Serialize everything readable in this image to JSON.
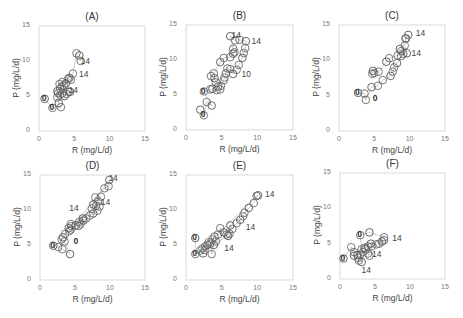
{
  "figure": {
    "xlabel": "R (mg/L/d)",
    "ylabel": "P (mg/L/d)",
    "ticks": [
      "0",
      "5",
      "10",
      "15"
    ]
  },
  "chart_data": [
    {
      "type": "scatter",
      "title": "(A)",
      "xlabel": "R (mg/L/d)",
      "ylabel": "P (mg/L/d)",
      "xlim": [
        0,
        15
      ],
      "ylim": [
        0,
        15
      ],
      "grid": false,
      "annotations": [
        {
          "text": "14",
          "x": 6.3,
          "y": 9.8
        },
        {
          "text": "14",
          "x": 6.1,
          "y": 8.0
        },
        {
          "text": "14",
          "x": 4.6,
          "y": 5.7
        },
        {
          "text": "0",
          "x": 0.8,
          "y": 4.6
        },
        {
          "text": "0",
          "x": 1.9,
          "y": 3.3
        }
      ],
      "points": [
        [
          0.8,
          4.6
        ],
        [
          1.9,
          3.3
        ],
        [
          3.1,
          3.4
        ],
        [
          2.8,
          4.0
        ],
        [
          2.6,
          4.8
        ],
        [
          2.7,
          5.4
        ],
        [
          2.6,
          5.7
        ],
        [
          3.0,
          5.2
        ],
        [
          3.3,
          5.4
        ],
        [
          3.6,
          5.0
        ],
        [
          3.9,
          5.3
        ],
        [
          4.2,
          5.6
        ],
        [
          4.4,
          5.6
        ],
        [
          3.0,
          6.0
        ],
        [
          3.2,
          6.3
        ],
        [
          3.5,
          6.5
        ],
        [
          2.9,
          6.7
        ],
        [
          3.3,
          7.0
        ],
        [
          3.8,
          6.8
        ],
        [
          4.1,
          7.4
        ],
        [
          4.5,
          7.3
        ],
        [
          4.3,
          7.6
        ],
        [
          4.8,
          8.2
        ],
        [
          5.3,
          11.1
        ],
        [
          5.7,
          10.8
        ],
        [
          5.9,
          10.0
        ]
      ]
    },
    {
      "type": "scatter",
      "title": "(B)",
      "xlabel": "R (mg/L/d)",
      "ylabel": "P (mg/L/d)",
      "xlim": [
        0,
        15
      ],
      "ylim": [
        0,
        15
      ],
      "grid": false,
      "annotations": [
        {
          "text": "14",
          "x": 6.8,
          "y": 13.5
        },
        {
          "text": "14",
          "x": 9.6,
          "y": 12.6
        },
        {
          "text": "10",
          "x": 8.2,
          "y": 7.9
        },
        {
          "text": "0",
          "x": 2.5,
          "y": 5.5
        },
        {
          "text": "0",
          "x": 2.5,
          "y": 2.1
        }
      ],
      "points": [
        [
          2.0,
          2.9
        ],
        [
          2.5,
          2.1
        ],
        [
          2.9,
          4.0
        ],
        [
          3.6,
          3.5
        ],
        [
          2.5,
          5.5
        ],
        [
          3.4,
          5.8
        ],
        [
          3.7,
          5.9
        ],
        [
          4.3,
          5.7
        ],
        [
          4.8,
          5.8
        ],
        [
          4.5,
          6.2
        ],
        [
          4.9,
          6.3
        ],
        [
          4.2,
          6.8
        ],
        [
          4.0,
          7.4
        ],
        [
          3.5,
          7.7
        ],
        [
          3.9,
          8.1
        ],
        [
          4.8,
          9.7
        ],
        [
          5.3,
          10.3
        ],
        [
          6.2,
          10.4
        ],
        [
          6.6,
          10.9
        ],
        [
          6.8,
          11.1
        ],
        [
          6.6,
          11.6
        ],
        [
          6.2,
          13.4
        ],
        [
          6.9,
          12.8
        ],
        [
          7.5,
          12.9
        ],
        [
          8.4,
          12.7
        ],
        [
          8.3,
          11.7
        ],
        [
          8.1,
          11.0
        ],
        [
          7.9,
          10.3
        ],
        [
          7.4,
          9.3
        ],
        [
          7.1,
          8.6
        ],
        [
          6.6,
          8.0
        ],
        [
          6.2,
          8.7
        ],
        [
          5.8,
          8.8
        ],
        [
          5.6,
          8.1
        ],
        [
          5.4,
          7.5
        ],
        [
          5.3,
          7.1
        ]
      ]
    },
    {
      "type": "scatter",
      "title": "(C)",
      "xlabel": "R (mg/L/d)",
      "ylabel": "P (mg/L/d)",
      "xlim": [
        0,
        15
      ],
      "ylim": [
        0,
        15
      ],
      "grid": false,
      "annotations": [
        {
          "text": "14",
          "x": 11.3,
          "y": 13.7
        },
        {
          "text": "14",
          "x": 10.7,
          "y": 10.9
        },
        {
          "text": "0",
          "x": 2.7,
          "y": 5.4
        },
        {
          "text": "0",
          "x": 5.2,
          "y": 4.5
        }
      ],
      "points": [
        [
          2.7,
          5.4
        ],
        [
          3.6,
          5.3
        ],
        [
          3.8,
          4.4
        ],
        [
          4.6,
          6.2
        ],
        [
          5.5,
          6.4
        ],
        [
          6.2,
          7.2
        ],
        [
          7.3,
          7.8
        ],
        [
          7.6,
          8.4
        ],
        [
          7.8,
          9.0
        ],
        [
          8.2,
          9.6
        ],
        [
          8.8,
          10.6
        ],
        [
          9.1,
          10.9
        ],
        [
          9.6,
          11.0
        ],
        [
          9.3,
          12.1
        ],
        [
          9.4,
          13.1
        ],
        [
          9.8,
          13.6
        ],
        [
          9.5,
          13.1
        ],
        [
          8.8,
          11.3
        ],
        [
          8.6,
          11.6
        ],
        [
          8.3,
          10.7
        ],
        [
          7.1,
          10.3
        ],
        [
          6.7,
          9.8
        ],
        [
          5.6,
          8.4
        ],
        [
          5.0,
          8.2
        ],
        [
          4.8,
          8.5
        ],
        [
          4.7,
          8.1
        ]
      ]
    },
    {
      "type": "scatter",
      "title": "(D)",
      "xlabel": "R (mg/L/d)",
      "ylabel": "P (mg/L/d)",
      "xlim": [
        0,
        15
      ],
      "ylim": [
        0,
        15
      ],
      "grid": false,
      "annotations": [
        {
          "text": "14",
          "x": 10.2,
          "y": 14.5
        },
        {
          "text": "14",
          "x": 9.1,
          "y": 11.0
        },
        {
          "text": "14",
          "x": 4.6,
          "y": 10.1
        },
        {
          "text": "0",
          "x": 5.2,
          "y": 5.4
        },
        {
          "text": "0",
          "x": 1.9,
          "y": 4.9
        }
      ],
      "points": [
        [
          1.9,
          4.9
        ],
        [
          2.6,
          4.7
        ],
        [
          3.2,
          4.4
        ],
        [
          4.3,
          3.7
        ],
        [
          3.5,
          5.5
        ],
        [
          3.1,
          5.8
        ],
        [
          3.3,
          6.1
        ],
        [
          3.6,
          6.6
        ],
        [
          4.2,
          7.0
        ],
        [
          4.1,
          7.4
        ],
        [
          4.5,
          7.7
        ],
        [
          4.4,
          8.0
        ],
        [
          5.1,
          7.8
        ],
        [
          5.5,
          7.7
        ],
        [
          5.8,
          8.0
        ],
        [
          6.2,
          8.5
        ],
        [
          6.6,
          8.8
        ],
        [
          7.1,
          9.2
        ],
        [
          7.6,
          9.5
        ],
        [
          8.2,
          9.9
        ],
        [
          8.5,
          10.5
        ],
        [
          8.3,
          11.2
        ],
        [
          8.7,
          11.9
        ],
        [
          7.9,
          11.8
        ],
        [
          7.6,
          10.8
        ],
        [
          9.2,
          13.1
        ],
        [
          9.8,
          13.4
        ],
        [
          9.9,
          14.3
        ],
        [
          4.4,
          7.2
        ],
        [
          5.6,
          8.3
        ],
        [
          6.1,
          8.8
        ],
        [
          7.4,
          10.2
        ],
        [
          8.0,
          10.6
        ]
      ]
    },
    {
      "type": "scatter",
      "title": "(E)",
      "xlabel": "R (mg/L/d)",
      "ylabel": "P (mg/L/d)",
      "xlim": [
        0,
        15
      ],
      "ylim": [
        0,
        15
      ],
      "grid": false,
      "annotations": [
        {
          "text": "14",
          "x": 11.5,
          "y": 12.2
        },
        {
          "text": "14",
          "x": 8.8,
          "y": 7.5
        },
        {
          "text": "14",
          "x": 5.8,
          "y": 4.5
        },
        {
          "text": "0",
          "x": 1.3,
          "y": 6.0
        },
        {
          "text": "0",
          "x": 1.3,
          "y": 3.7
        }
      ],
      "points": [
        [
          1.3,
          6.0
        ],
        [
          1.3,
          3.7
        ],
        [
          2.0,
          4.2
        ],
        [
          2.4,
          3.8
        ],
        [
          2.3,
          4.5
        ],
        [
          2.7,
          4.8
        ],
        [
          3.0,
          5.0
        ],
        [
          3.4,
          5.2
        ],
        [
          3.6,
          3.7
        ],
        [
          3.9,
          5.0
        ],
        [
          4.2,
          5.5
        ],
        [
          3.7,
          5.8
        ],
        [
          4.0,
          6.2
        ],
        [
          4.5,
          6.5
        ],
        [
          4.8,
          7.4
        ],
        [
          5.3,
          6.8
        ],
        [
          5.7,
          6.5
        ],
        [
          6.1,
          6.6
        ],
        [
          6.2,
          7.8
        ],
        [
          6.5,
          7.3
        ],
        [
          7.1,
          8.1
        ],
        [
          7.6,
          8.6
        ],
        [
          8.0,
          9.1
        ],
        [
          8.2,
          9.6
        ],
        [
          8.8,
          10.3
        ],
        [
          9.5,
          11.0
        ],
        [
          9.9,
          12.0
        ],
        [
          10.1,
          12.1
        ],
        [
          3.2,
          5.4
        ],
        [
          2.6,
          4.3
        ],
        [
          5.9,
          6.3
        ]
      ]
    },
    {
      "type": "scatter",
      "title": "(F)",
      "xlabel": "R (mg/L/d)",
      "ylabel": "P (mg/L/d)",
      "xlim": [
        0,
        15
      ],
      "ylim": [
        0,
        15
      ],
      "grid": false,
      "annotations": [
        {
          "text": "14",
          "x": 7.9,
          "y": 5.7
        },
        {
          "text": "14",
          "x": 5.0,
          "y": 3.4
        },
        {
          "text": "14",
          "x": 3.5,
          "y": 1.1
        },
        {
          "text": "0",
          "x": 0.5,
          "y": 2.9
        },
        {
          "text": "0",
          "x": 2.9,
          "y": 6.2
        }
      ],
      "points": [
        [
          0.5,
          2.9
        ],
        [
          1.6,
          4.5
        ],
        [
          2.0,
          3.8
        ],
        [
          2.0,
          3.3
        ],
        [
          2.6,
          3.0
        ],
        [
          2.7,
          2.6
        ],
        [
          3.1,
          2.4
        ],
        [
          2.9,
          3.4
        ],
        [
          3.3,
          3.8
        ],
        [
          3.7,
          4.2
        ],
        [
          4.0,
          3.6
        ],
        [
          4.2,
          3.3
        ],
        [
          3.5,
          4.4
        ],
        [
          4.0,
          4.6
        ],
        [
          4.5,
          4.6
        ],
        [
          4.4,
          5.0
        ],
        [
          5.2,
          4.9
        ],
        [
          5.6,
          5.0
        ],
        [
          6.0,
          5.3
        ],
        [
          6.3,
          5.5
        ],
        [
          6.3,
          5.9
        ],
        [
          4.2,
          6.6
        ],
        [
          2.9,
          6.2
        ],
        [
          3.1,
          4.2
        ],
        [
          2.5,
          3.4
        ]
      ]
    }
  ]
}
